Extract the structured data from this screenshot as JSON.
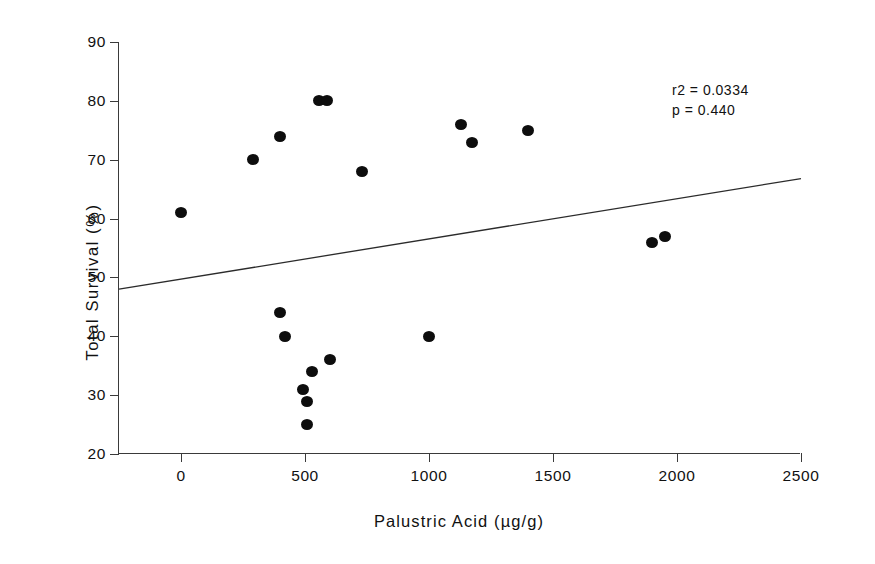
{
  "chart_data": {
    "type": "scatter",
    "title": "",
    "xlabel": "Palustric Acid (µg/g)",
    "ylabel": "Total Survival (%)",
    "xlim": [
      -250,
      2500
    ],
    "ylim": [
      20,
      90
    ],
    "xticks": [
      0,
      500,
      1000,
      1500,
      2000,
      2500
    ],
    "xtick_labels": [
      "0",
      "500",
      "1000",
      "1500",
      "2000",
      "2500"
    ],
    "yticks": [
      20,
      30,
      40,
      50,
      60,
      70,
      80,
      90
    ],
    "ytick_labels": [
      "20",
      "30",
      "40",
      "50",
      "60",
      "70",
      "80",
      "90"
    ],
    "grid": false,
    "legend": null,
    "marker": {
      "shape": "circle",
      "color": "#0d0d0d",
      "size": 11
    },
    "points": [
      {
        "x": 0,
        "y": 61
      },
      {
        "x": 290,
        "y": 70
      },
      {
        "x": 400,
        "y": 74
      },
      {
        "x": 555,
        "y": 80
      },
      {
        "x": 590,
        "y": 80
      },
      {
        "x": 730,
        "y": 68
      },
      {
        "x": 1130,
        "y": 76
      },
      {
        "x": 1175,
        "y": 73
      },
      {
        "x": 1400,
        "y": 75
      },
      {
        "x": 1900,
        "y": 56
      },
      {
        "x": 1950,
        "y": 57
      },
      {
        "x": 400,
        "y": 44
      },
      {
        "x": 420,
        "y": 40
      },
      {
        "x": 490,
        "y": 31
      },
      {
        "x": 510,
        "y": 29
      },
      {
        "x": 530,
        "y": 34
      },
      {
        "x": 600,
        "y": 36
      },
      {
        "x": 510,
        "y": 25
      },
      {
        "x": 1000,
        "y": 40
      }
    ],
    "trendline": {
      "type": "linear",
      "x_start": -250,
      "y_start": 48.0,
      "x_end": 2500,
      "y_end": 66.8,
      "color": "#2b2b2b",
      "width": 1.3
    },
    "annotations": [
      {
        "name": "r-squared",
        "text": "r2 = 0.0334"
      },
      {
        "name": "p-value",
        "text": "p = 0.440"
      }
    ]
  }
}
